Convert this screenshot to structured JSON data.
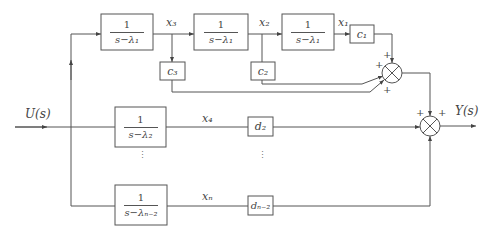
{
  "diagram": {
    "type": "block-diagram",
    "input_label": "U(s)",
    "output_label": "Y(s)",
    "blocks": [
      {
        "id": "b1",
        "num": "1",
        "den": "s−λ₁",
        "output": "x₃"
      },
      {
        "id": "b2",
        "num": "1",
        "den": "s−λ₁",
        "output": "x₂"
      },
      {
        "id": "b3",
        "num": "1",
        "den": "s−λ₁",
        "output": "x₁"
      },
      {
        "id": "b4",
        "num": "1",
        "den": "s−λ₂",
        "output": "x₄"
      },
      {
        "id": "b5",
        "num": "1",
        "den": "s−λₙ₋₂",
        "output": "xₙ"
      }
    ],
    "gains": [
      {
        "id": "c1",
        "label": "c₁"
      },
      {
        "id": "c2",
        "label": "c₂"
      },
      {
        "id": "c3",
        "label": "c₃"
      },
      {
        "id": "d2",
        "label": "d₂"
      },
      {
        "id": "dn2",
        "label": "dₙ₋₂"
      }
    ],
    "signals": {
      "x1": "x₁",
      "x2": "x₂",
      "x3": "x₃",
      "x4": "x₄",
      "xn": "xₙ"
    },
    "summers": [
      {
        "id": "sum1",
        "signs": [
          "+",
          "+",
          "+"
        ]
      },
      {
        "id": "sum2",
        "signs": [
          "+",
          "+"
        ]
      }
    ],
    "ellipsis": "⋮"
  }
}
